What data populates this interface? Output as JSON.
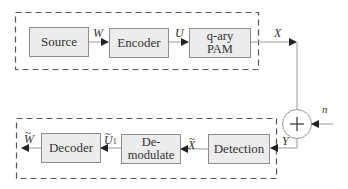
{
  "diagram": {
    "transmitter": {
      "blocks": [
        {
          "id": "source",
          "label": "Source"
        },
        {
          "id": "encoder",
          "label": "Encoder"
        },
        {
          "id": "modulator",
          "label_line1": "q-ary",
          "label_line2": "PAM"
        }
      ],
      "signals": {
        "w": "W",
        "u": "U",
        "x": "X"
      }
    },
    "channel": {
      "adder_symbol": "+",
      "noise": "n",
      "output": "Y"
    },
    "receiver": {
      "blocks": [
        {
          "id": "detection",
          "label": "Detection"
        },
        {
          "id": "demodulate",
          "label_line1": "De-",
          "label_line2": "modulate"
        },
        {
          "id": "decoder",
          "label": "Decoder"
        }
      ],
      "signals": {
        "x_hat": "X",
        "u_hat": "U",
        "u_hat_sub": "1",
        "w_hat": "W",
        "tilde": "~"
      }
    },
    "colors": {
      "block_fill": "#ececec",
      "block_border": "#8c8c8c",
      "line": "#9a9a9a",
      "dash": "#555555",
      "arrow": "#222222"
    }
  }
}
